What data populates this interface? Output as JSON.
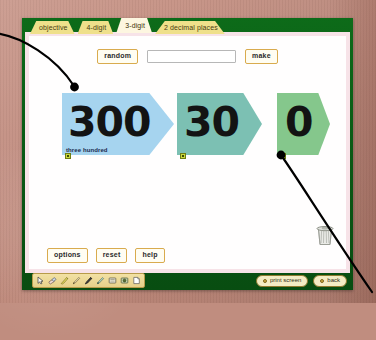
{
  "app": {
    "title": "place value cards activity",
    "background_color": "#c08d7f",
    "chrome_color": "#0b5e16",
    "panel_color": "#ffffff",
    "panel_border_color": "#f7e3e8"
  },
  "tabs": [
    {
      "label": "objective",
      "active": false,
      "name": "tab-objective"
    },
    {
      "label": "4-digit",
      "active": false,
      "name": "tab-4-digit"
    },
    {
      "label": "3-digit",
      "active": true,
      "name": "tab-3-digit"
    },
    {
      "label": "2 decimal places",
      "active": false,
      "name": "tab-2-decimal-places"
    }
  ],
  "controls": {
    "random_label": "random",
    "make_label": "make",
    "number_input_value": "",
    "number_input_placeholder": ""
  },
  "cards": [
    {
      "name": "place-value-card-hundreds",
      "digits": "300",
      "word": "three hundred",
      "color": "#a6d4ef",
      "handle_color": "#c9d83c"
    },
    {
      "name": "place-value-card-tens",
      "digits": "30",
      "word": "",
      "color": "#7cc0b3",
      "handle_color": "#c9d83c"
    },
    {
      "name": "place-value-card-ones",
      "digits": "0",
      "word": "",
      "color": "#85c78c",
      "handle_color": "#c9d83c"
    }
  ],
  "page_buttons": [
    {
      "label": "options",
      "name": "options-button"
    },
    {
      "label": "reset",
      "name": "reset-button"
    },
    {
      "label": "help",
      "name": "help-button"
    }
  ],
  "draw_tools": [
    {
      "name": "pointer-tool-icon",
      "title": "pointer"
    },
    {
      "name": "eraser-tool-icon",
      "title": "eraser"
    },
    {
      "name": "highlighter-tool-icon",
      "title": "highlighter"
    },
    {
      "name": "thin-pen-tool-icon",
      "title": "thin pen"
    },
    {
      "name": "marker-pen-tool-icon",
      "title": "marker pen"
    },
    {
      "name": "pencil-tool-icon",
      "title": "pencil"
    },
    {
      "name": "note-tool-icon",
      "title": "note"
    },
    {
      "name": "stamp-tool-icon",
      "title": "stamp"
    },
    {
      "name": "page-tool-icon",
      "title": "new page"
    }
  ],
  "footer": {
    "print_screen_label": "print screen",
    "back_label": "back"
  },
  "trash": {
    "name": "trash-bin-icon",
    "title": "bin"
  },
  "annotations": {
    "arrow_left_label": "",
    "arrow_right_label": ""
  }
}
